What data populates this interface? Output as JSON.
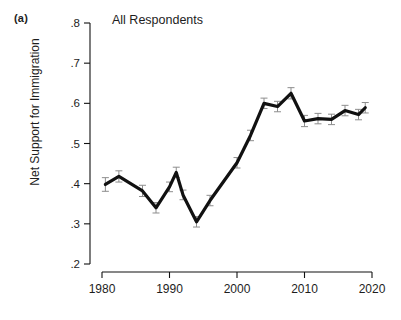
{
  "figure": {
    "panel_label": "(a)",
    "title": "All Respondents"
  },
  "chart_data": {
    "type": "line",
    "title": "All Respondents",
    "panel": "(a)",
    "xlabel": "",
    "ylabel": "Net Support for Immigration",
    "xlim": [
      1978,
      2022
    ],
    "ylim": [
      0.2,
      0.8
    ],
    "grid": false,
    "legend": null,
    "error_bars": true,
    "error_bar_style": "vertical-capped-95ci",
    "xticks": [
      1980,
      1990,
      2000,
      2010,
      2020
    ],
    "xtick_labels": [
      "1980",
      "1990",
      "2000",
      "2010",
      "2020"
    ],
    "yticks": [
      0.2,
      0.3,
      0.4,
      0.5,
      0.6,
      0.7,
      0.8
    ],
    "ytick_labels": [
      ".2",
      ".3",
      ".4",
      ".5",
      ".6",
      ".7",
      ".8"
    ],
    "series": [
      {
        "name": "Net Support for Immigration",
        "color": "#111111",
        "x": [
          1980.5,
          1982.5,
          1986,
          1988,
          1990,
          1991,
          1992,
          1994,
          1996,
          2000,
          2002,
          2004,
          2006,
          2008,
          2010,
          2012,
          2014,
          2016,
          2018,
          2019
        ],
        "values": [
          0.398,
          0.418,
          0.382,
          0.34,
          0.392,
          0.428,
          0.372,
          0.305,
          0.358,
          0.452,
          0.52,
          0.6,
          0.592,
          0.625,
          0.556,
          0.562,
          0.56,
          0.582,
          0.572,
          0.589
        ],
        "errors": [
          0.017,
          0.014,
          0.014,
          0.013,
          0.012,
          0.013,
          0.012,
          0.013,
          0.013,
          0.013,
          0.013,
          0.013,
          0.013,
          0.014,
          0.014,
          0.013,
          0.013,
          0.013,
          0.013,
          0.013
        ]
      }
    ]
  },
  "axes": {
    "y_title": "Net Support for Immigration"
  }
}
